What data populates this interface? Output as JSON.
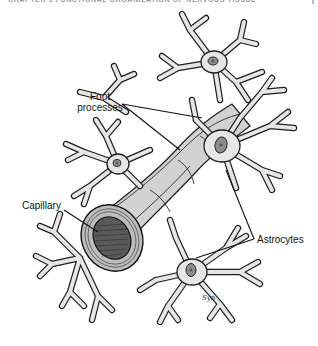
{
  "page": {
    "running_head": "CHAPTER 3  FUNCTIONAL ORGANIZATION OF NERVOUS TISSUE"
  },
  "figure": {
    "labels": {
      "foot_processes_line1": "Foot",
      "foot_processes_line2": "processes",
      "capillary": "Capillary",
      "astrocytes": "Astrocytes"
    },
    "signature": "Syn",
    "colors": {
      "cell_fill": "#e6e6e6",
      "outline": "#1e1e1e",
      "nucleus": "#8d8d8d",
      "vessel": "#d2d2d2",
      "lumen": "#5a5a5a"
    }
  }
}
